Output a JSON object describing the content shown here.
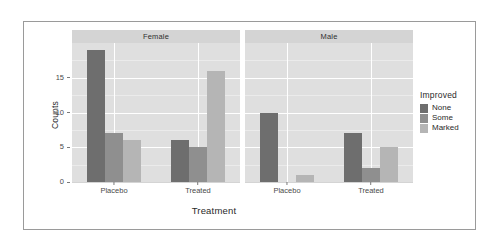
{
  "chart_data": {
    "type": "bar",
    "title": "",
    "xlabel": "Treatment",
    "ylabel": "Counts",
    "ylim": [
      0,
      20
    ],
    "yticks": [
      0,
      5,
      10,
      15
    ],
    "minor_yticks": [
      2.5,
      7.5,
      12.5,
      17.5
    ],
    "grid": true,
    "legend_position": "right",
    "legend_title": "Improved",
    "facet_variable": "Sex",
    "facets": [
      "Female",
      "Male"
    ],
    "categories": [
      "Placebo",
      "Treated"
    ],
    "series": [
      {
        "name": "None",
        "color": "#6e6e6e"
      },
      {
        "name": "Some",
        "color": "#8f8f8f"
      },
      {
        "name": "Marked",
        "color": "#b5b5b5"
      }
    ],
    "panels": [
      {
        "facet": "Female",
        "groups": [
          {
            "category": "Placebo",
            "values": [
              19,
              7,
              6
            ]
          },
          {
            "category": "Treated",
            "values": [
              6,
              5,
              16
            ]
          }
        ]
      },
      {
        "facet": "Male",
        "groups": [
          {
            "category": "Placebo",
            "values": [
              10,
              0,
              1
            ]
          },
          {
            "category": "Treated",
            "values": [
              7,
              2,
              5
            ]
          }
        ]
      }
    ]
  },
  "colors": {
    "panel_background": "#dfdfdf",
    "strip_background": "#d4d4d4",
    "gridline": "#ffffff",
    "figure_border": "#9a9a9a",
    "page_background": "#ffffff",
    "text": "#2a2a2a"
  }
}
